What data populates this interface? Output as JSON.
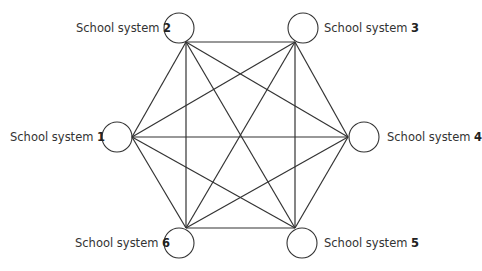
{
  "diagram": {
    "type": "complete-graph",
    "stroke_color": "#333333",
    "nodes": [
      {
        "id": 1,
        "prefix": "School system",
        "number": "1",
        "cx": 117,
        "cy": 137,
        "ax": 132,
        "ay": 137
      },
      {
        "id": 2,
        "prefix": "School system",
        "number": "2",
        "cx": 179,
        "cy": 28,
        "ax": 186,
        "ay": 42
      },
      {
        "id": 3,
        "prefix": "School system",
        "number": "3",
        "cx": 303,
        "cy": 28,
        "ax": 295,
        "ay": 42
      },
      {
        "id": 4,
        "prefix": "School system",
        "number": "4",
        "cx": 364,
        "cy": 137,
        "ax": 348,
        "ay": 137
      },
      {
        "id": 5,
        "prefix": "School system",
        "number": "5",
        "cx": 302,
        "cy": 243,
        "ax": 295,
        "ay": 228
      },
      {
        "id": 6,
        "prefix": "School system",
        "number": "6",
        "cx": 179,
        "cy": 243,
        "ax": 186,
        "ay": 228
      }
    ],
    "edges": [
      [
        1,
        2
      ],
      [
        1,
        3
      ],
      [
        1,
        4
      ],
      [
        1,
        5
      ],
      [
        1,
        6
      ],
      [
        2,
        3
      ],
      [
        2,
        4
      ],
      [
        2,
        5
      ],
      [
        2,
        6
      ],
      [
        3,
        4
      ],
      [
        3,
        5
      ],
      [
        3,
        6
      ],
      [
        4,
        5
      ],
      [
        4,
        6
      ],
      [
        5,
        6
      ]
    ]
  }
}
